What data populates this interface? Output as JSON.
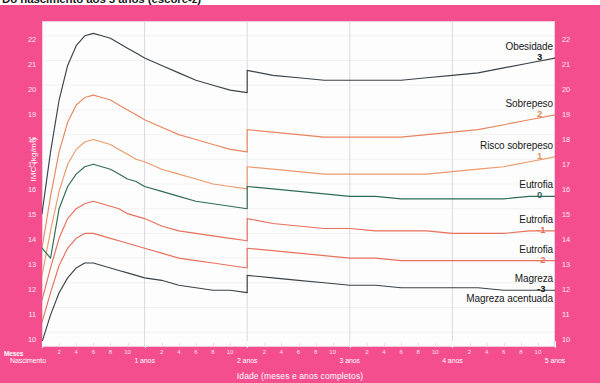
{
  "title": "Do nascimento aos 5 anos (escore-z)",
  "axes": {
    "y_label": "IMC (kg/m²)",
    "x_label": "Idade (meses e anos completos)",
    "months_label": "Meses",
    "birth_label": "Nascimento",
    "y_ticks": [
      "22",
      "21",
      "20",
      "19",
      "18",
      "17",
      "16",
      "15",
      "14",
      "13",
      "12",
      "11",
      "10"
    ],
    "month_ticks": [
      "2",
      "4",
      "6",
      "8",
      "10",
      "2",
      "4",
      "6",
      "8",
      "10",
      "2",
      "4",
      "6",
      "8",
      "10",
      "2",
      "4",
      "6",
      "8",
      "10",
      "2",
      "4",
      "6",
      "8",
      "10"
    ],
    "year_labels": [
      "1 anos",
      "2 anos",
      "3 anos",
      "4 anos",
      "5 anos"
    ]
  },
  "colors": {
    "panel_pink": "#f54e8e",
    "plot_bg": "#fdfdfd",
    "grid": "#d9d9e0",
    "curve_z3": "#3c4248",
    "curve_z2": "#e8875f",
    "curve_z1": "#eb9a6b",
    "curve_z0": "#2f6b58",
    "curve_zm1": "#e8705c",
    "curve_zm2": "#e8705c",
    "curve_zm3": "#3c4248",
    "tick_text": "#ffe9f1",
    "legend_text": "#17181a"
  },
  "legend": [
    {
      "name": "Obesidade",
      "z": "3",
      "color": "#17181a"
    },
    {
      "name": "Sobrepeso",
      "z": "2",
      "color": "#e08a52"
    },
    {
      "name": "Risco  sobrepeso",
      "z": "1",
      "color": "#e09a5c"
    },
    {
      "name": "Eutrofia",
      "z": "0",
      "color": "#2f6b58"
    },
    {
      "name": "Eutrofia",
      "z": "-1",
      "color": "#e8705c"
    },
    {
      "name": "Eutrofia",
      "z": "-2",
      "color": "#e8705c"
    },
    {
      "name": "Magreza",
      "z": "-3",
      "color": "#17181a"
    },
    {
      "name": "Magreza acentuada",
      "z": "",
      "color": "#17181a"
    }
  ],
  "chart_data": {
    "type": "line",
    "title": "Do nascimento aos 5 anos (escore-z)",
    "xlabel": "Idade (meses e anos completos)",
    "ylabel": "IMC (kg/m²)",
    "xlim": [
      0,
      60
    ],
    "ylim": [
      9.4,
      22.6
    ],
    "grid": true,
    "legend_position": "right",
    "x_unit": "months",
    "x": [
      0,
      1,
      2,
      3,
      4,
      5,
      6,
      7,
      8,
      9,
      10,
      11,
      12,
      14,
      16,
      18,
      20,
      22,
      24,
      24,
      27,
      30,
      33,
      36,
      39,
      42,
      45,
      48,
      51,
      54,
      57,
      60
    ],
    "series": [
      {
        "name": "Obesidade (z=+3)",
        "z": 3,
        "color": "#3c4248",
        "values": [
          14.8,
          17.3,
          19.4,
          20.8,
          21.6,
          22.0,
          22.1,
          22.0,
          21.9,
          21.7,
          21.5,
          21.3,
          21.1,
          20.8,
          20.5,
          20.2,
          20.0,
          19.8,
          19.7,
          20.6,
          20.4,
          20.3,
          20.2,
          20.2,
          20.2,
          20.2,
          20.3,
          20.4,
          20.5,
          20.7,
          20.9,
          21.1
        ]
      },
      {
        "name": "Sobrepeso (z=+2)",
        "z": 2,
        "color": "#e8875f",
        "values": [
          13.4,
          15.5,
          17.3,
          18.5,
          19.2,
          19.5,
          19.6,
          19.5,
          19.4,
          19.2,
          19.0,
          18.8,
          18.6,
          18.3,
          18.0,
          17.8,
          17.6,
          17.4,
          17.3,
          18.2,
          18.1,
          18.0,
          17.9,
          17.9,
          17.9,
          17.9,
          18.0,
          18.1,
          18.2,
          18.4,
          18.6,
          18.8
        ]
      },
      {
        "name": "Risco sobrepeso (z=+1)",
        "z": 1,
        "color": "#eb9a6b",
        "values": [
          12.3,
          14.1,
          15.7,
          16.8,
          17.4,
          17.7,
          17.8,
          17.7,
          17.6,
          17.4,
          17.2,
          17.0,
          16.9,
          16.6,
          16.4,
          16.2,
          16.0,
          15.9,
          15.8,
          16.7,
          16.6,
          16.5,
          16.4,
          16.4,
          16.4,
          16.4,
          16.4,
          16.5,
          16.6,
          16.7,
          16.9,
          17.1
        ]
      },
      {
        "name": "Eutrofia (z=0)",
        "z": 0,
        "color": "#2f6b58",
        "values": [
          13.4,
          13.0,
          15.0,
          15.9,
          16.4,
          16.7,
          16.8,
          16.7,
          16.6,
          16.4,
          16.2,
          16.1,
          15.9,
          15.7,
          15.5,
          15.3,
          15.2,
          15.1,
          15.0,
          15.9,
          15.8,
          15.7,
          15.6,
          15.5,
          15.5,
          15.4,
          15.4,
          15.4,
          15.4,
          15.4,
          15.5,
          15.5
        ]
      },
      {
        "name": "Eutrofia (z=-1)",
        "z": -1,
        "color": "#e8705c",
        "values": [
          11.3,
          12.6,
          13.8,
          14.6,
          15.0,
          15.2,
          15.3,
          15.2,
          15.1,
          15.0,
          14.8,
          14.7,
          14.6,
          14.3,
          14.1,
          14.0,
          13.9,
          13.8,
          13.7,
          14.6,
          14.4,
          14.3,
          14.2,
          14.2,
          14.1,
          14.1,
          14.1,
          14.0,
          14.0,
          14.0,
          14.1,
          14.1
        ]
      },
      {
        "name": "Eutrofia (z=-2)",
        "z": -2,
        "color": "#e8705c",
        "values": [
          10.4,
          11.6,
          12.7,
          13.4,
          13.8,
          14.0,
          14.0,
          13.9,
          13.8,
          13.7,
          13.6,
          13.5,
          13.4,
          13.2,
          13.0,
          12.9,
          12.8,
          12.7,
          12.6,
          13.4,
          13.3,
          13.2,
          13.1,
          13.0,
          13.0,
          12.9,
          12.9,
          12.9,
          12.9,
          12.9,
          12.9,
          12.9
        ]
      },
      {
        "name": "Magreza (z=-3)",
        "z": -3,
        "color": "#3c4248",
        "values": [
          9.6,
          10.7,
          11.6,
          12.2,
          12.6,
          12.8,
          12.8,
          12.7,
          12.6,
          12.5,
          12.4,
          12.3,
          12.2,
          12.1,
          11.9,
          11.8,
          11.7,
          11.7,
          11.6,
          12.3,
          12.2,
          12.1,
          12.0,
          11.9,
          11.9,
          11.8,
          11.8,
          11.8,
          11.8,
          11.7,
          11.7,
          11.7
        ]
      }
    ],
    "annotations": [
      "Discontinuidade na curva aos 2 anos (mudança de comprimento para estatura)"
    ]
  }
}
